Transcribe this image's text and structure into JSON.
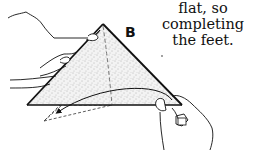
{
  "caption": {
    "line1": "flat, so completing",
    "line2": "the feet."
  },
  "diagram": {
    "label": "B",
    "shape": "folded paper triangle (shaded) held by two hands",
    "fold_arrow": "curved arrow indicating flap folded down-left",
    "hidden_flap": "dashed triangle below base",
    "crease": "dashed vertical crease from apex"
  },
  "colors": {
    "line": "#111111",
    "background": "#ffffff",
    "stipple": "#888888"
  }
}
